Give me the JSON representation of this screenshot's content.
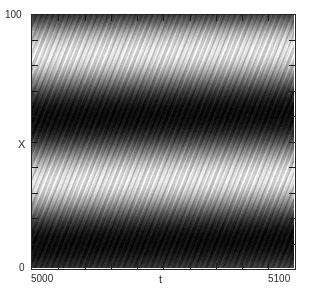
{
  "figure": {
    "type": "spatiotemporal-density-plot",
    "background_color": "#ffffff",
    "width": 310,
    "height": 298
  },
  "axes": {
    "y": {
      "label": "X",
      "ticks": [
        {
          "value": 0,
          "label": "0"
        },
        {
          "value": 100,
          "label": "100"
        }
      ],
      "min": 0,
      "max": 100,
      "minor_tick_count": 9
    },
    "x": {
      "label": "t",
      "ticks": [
        {
          "value": 5000,
          "label": "5000"
        },
        {
          "value": 5100,
          "label": "5100"
        }
      ],
      "min": 5000,
      "max": 5100,
      "minor_tick_count": 9
    }
  },
  "chart_data": {
    "type": "heatmap",
    "title": "",
    "xlabel": "t",
    "ylabel": "X",
    "xlim": [
      5000,
      5100
    ],
    "ylim": [
      0,
      100
    ],
    "grid": false,
    "legend": false,
    "colormap": "gray",
    "value_range": [
      0,
      1
    ],
    "structure": {
      "dark_band_centers_X": [
        83,
        34
      ],
      "bright_band_centers_X": [
        62,
        12
      ],
      "band_drift_per_unit_t": 0.02,
      "striation_slope_X_per_t": 2.6,
      "striation_spacing_t": 2.1,
      "striation_amplitude": 0.09,
      "noise_amplitude": 0.05,
      "top_edge_value": 0.42,
      "bottom_edge_value": 0.46
    },
    "x_samples": [
      5000,
      5010,
      5020,
      5030,
      5040,
      5050,
      5060,
      5070,
      5080,
      5090,
      5100
    ],
    "y_samples": [
      0,
      10,
      20,
      30,
      40,
      50,
      60,
      70,
      80,
      90,
      100
    ],
    "values": [
      [
        0.46,
        0.47,
        0.47,
        0.48,
        0.48,
        0.49,
        0.49,
        0.5,
        0.5,
        0.51,
        0.51
      ],
      [
        0.72,
        0.73,
        0.73,
        0.74,
        0.74,
        0.74,
        0.75,
        0.75,
        0.75,
        0.76,
        0.76
      ],
      [
        0.62,
        0.63,
        0.64,
        0.65,
        0.66,
        0.67,
        0.67,
        0.68,
        0.69,
        0.7,
        0.7
      ],
      [
        0.22,
        0.22,
        0.23,
        0.23,
        0.24,
        0.25,
        0.26,
        0.27,
        0.28,
        0.29,
        0.3
      ],
      [
        0.1,
        0.1,
        0.1,
        0.11,
        0.11,
        0.12,
        0.12,
        0.13,
        0.13,
        0.14,
        0.15
      ],
      [
        0.44,
        0.44,
        0.43,
        0.43,
        0.42,
        0.42,
        0.42,
        0.41,
        0.41,
        0.41,
        0.4
      ],
      [
        0.8,
        0.81,
        0.81,
        0.82,
        0.82,
        0.82,
        0.83,
        0.83,
        0.83,
        0.84,
        0.84
      ],
      [
        0.74,
        0.75,
        0.76,
        0.77,
        0.78,
        0.78,
        0.79,
        0.8,
        0.8,
        0.81,
        0.81
      ],
      [
        0.3,
        0.31,
        0.31,
        0.32,
        0.33,
        0.34,
        0.35,
        0.36,
        0.37,
        0.38,
        0.39
      ],
      [
        0.12,
        0.12,
        0.12,
        0.12,
        0.13,
        0.13,
        0.13,
        0.14,
        0.14,
        0.15,
        0.15
      ],
      [
        0.42,
        0.42,
        0.41,
        0.41,
        0.41,
        0.4,
        0.4,
        0.4,
        0.39,
        0.39,
        0.39
      ]
    ]
  }
}
